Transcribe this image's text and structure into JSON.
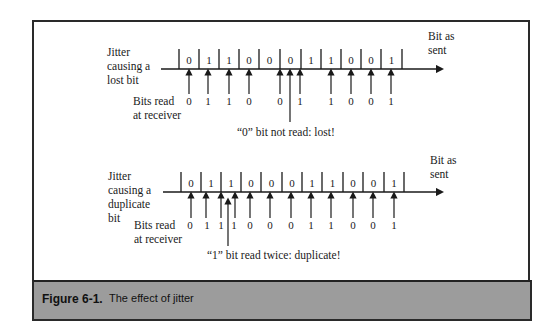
{
  "figure": {
    "number": "Figure 6-1.",
    "caption": "The effect of jitter",
    "colors": {
      "frame": "#2a2a2a",
      "caption_bar": "#9c9c9c",
      "line": "#1a1a1a"
    }
  },
  "lost_bit_diagram": {
    "side_label": [
      "Jitter",
      "causing a",
      "lost bit"
    ],
    "axis_label": [
      "Bit as",
      "sent"
    ],
    "bits_sent": [
      "0",
      "1",
      "1",
      "0",
      "0",
      "0",
      "1",
      "1",
      "0",
      "0",
      "1"
    ],
    "receiver_label": [
      "Bits read",
      "at receiver"
    ],
    "bits_read": [
      "0",
      "1",
      "1",
      "0",
      "0",
      "1",
      "1",
      "0",
      "0",
      "1"
    ],
    "annotation": "“0” bit not read: lost!"
  },
  "duplicate_bit_diagram": {
    "side_label": [
      "Jitter",
      "causing a",
      "duplicate",
      "bit"
    ],
    "axis_label": [
      "Bit as",
      "sent"
    ],
    "bits_sent": [
      "0",
      "1",
      "1",
      "0",
      "0",
      "0",
      "1",
      "1",
      "0",
      "0",
      "1"
    ],
    "receiver_label": [
      "Bits read",
      "at receiver"
    ],
    "bits_read": [
      "0",
      "1",
      "1",
      "1",
      "0",
      "0",
      "0",
      "1",
      "1",
      "0",
      "0",
      "1"
    ],
    "annotation": "“1” bit read twice: duplicate!"
  }
}
